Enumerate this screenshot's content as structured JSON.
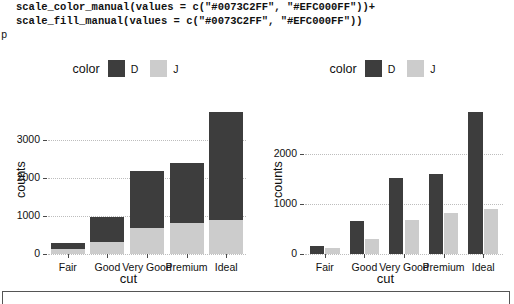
{
  "code": {
    "line1": "scale_color_manual(values = c(\"#0073C2FF\", \"#EFC000FF\"))+",
    "line2": "scale_fill_manual(values = c(\"#0073C2FF\", \"#EFC000FF\"))",
    "prompt": "p"
  },
  "palette": {
    "series_d_declared": "#0073C2FF",
    "series_j_declared": "#EFC000FF",
    "series_d_rendered": "#3d3d3d",
    "series_j_rendered": "#cccccc",
    "grid": "#bdbdbd",
    "axis": "#4a4a4a"
  },
  "legend": {
    "title": "color",
    "entries": [
      {
        "label": "D",
        "swatch": "#3d3d3d"
      },
      {
        "label": "J",
        "swatch": "#cccccc"
      }
    ]
  },
  "chart_data": [
    {
      "id": "left",
      "type": "bar",
      "bar_mode": "stacked",
      "title": "",
      "xlabel": "cut",
      "ylabel": "counts",
      "categories": [
        "Fair",
        "Good",
        "Very Good",
        "Premium",
        "Ideal"
      ],
      "yticks": [
        0,
        1000,
        2000,
        3000
      ],
      "ytick_labels": [
        "0",
        "1000",
        "2000",
        "3000"
      ],
      "ylim": [
        0,
        3900
      ],
      "grid": true,
      "legend_position": "top",
      "series": [
        {
          "name": "J",
          "values": [
            119,
            307,
            678,
            808,
            896
          ]
        },
        {
          "name": "D",
          "values": [
            163,
            662,
            1513,
            1603,
            2834
          ]
        }
      ],
      "stack_totals": [
        282,
        969,
        2191,
        2411,
        3730
      ]
    },
    {
      "id": "right",
      "type": "bar",
      "bar_mode": "grouped",
      "title": "",
      "xlabel": "cut",
      "ylabel": "counts",
      "categories": [
        "Fair",
        "Good",
        "Very Good",
        "Premium",
        "Ideal"
      ],
      "yticks": [
        0,
        1000,
        2000
      ],
      "ytick_labels": [
        "0",
        "1000",
        "2000"
      ],
      "ylim": [
        0,
        2950
      ],
      "grid": true,
      "legend_position": "top",
      "series": [
        {
          "name": "D",
          "values": [
            163,
            662,
            1513,
            1603,
            2834
          ]
        },
        {
          "name": "J",
          "values": [
            119,
            307,
            678,
            808,
            896
          ]
        }
      ]
    }
  ]
}
